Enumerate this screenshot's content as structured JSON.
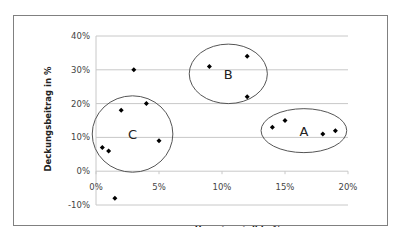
{
  "chart_data": {
    "type": "scatter",
    "title": "",
    "xlabel": "Umsatzanteil in %",
    "ylabel": "Deckungsbeitrag in %",
    "xlim": [
      0,
      20
    ],
    "ylim": [
      -10,
      40
    ],
    "x_ticks": [
      "0%",
      "5%",
      "10%",
      "15%",
      "20%"
    ],
    "y_ticks": [
      "40%",
      "30%",
      "20%",
      "10%",
      "0%",
      "-10%"
    ],
    "grid": "horizontal",
    "legend": "none",
    "series": [
      {
        "name": "Produkte",
        "marker": "diamond",
        "color": "#000000",
        "points": [
          {
            "x": 0.5,
            "y": 7
          },
          {
            "x": 1.0,
            "y": 6
          },
          {
            "x": 1.5,
            "y": -8
          },
          {
            "x": 2.0,
            "y": 18
          },
          {
            "x": 3.0,
            "y": 30
          },
          {
            "x": 4.0,
            "y": 20
          },
          {
            "x": 5.0,
            "y": 9
          },
          {
            "x": 9.0,
            "y": 31
          },
          {
            "x": 12.0,
            "y": 34
          },
          {
            "x": 12.0,
            "y": 22
          },
          {
            "x": 14.0,
            "y": 13
          },
          {
            "x": 15.0,
            "y": 15
          },
          {
            "x": 18.0,
            "y": 11
          },
          {
            "x": 19.0,
            "y": 12
          }
        ]
      }
    ],
    "annotations": [
      {
        "label": "A",
        "type": "ellipse",
        "cx": 16.5,
        "cy": 12,
        "rx": 3.4,
        "ry": 6.5
      },
      {
        "label": "B",
        "type": "ellipse",
        "cx": 10.5,
        "cy": 28.8,
        "rx": 3.1,
        "ry": 8.8
      },
      {
        "label": "C",
        "type": "ellipse",
        "cx": 2.9,
        "cy": 11,
        "rx": 3.2,
        "ry": 11.3
      }
    ]
  }
}
